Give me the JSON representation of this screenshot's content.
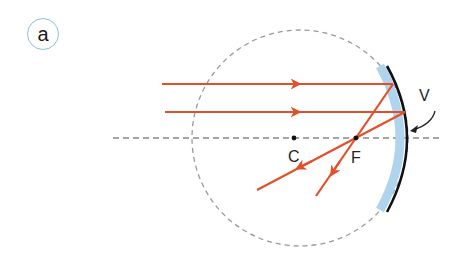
{
  "panel": {
    "label": "a"
  },
  "labels": {
    "center": "C",
    "focus": "F",
    "vertex": "V"
  },
  "colors": {
    "ray": "#e2502a",
    "mirror": "#111111",
    "mirror_surface": "#aed4ee",
    "axis": "#888888",
    "circle": "#999999",
    "badge_border": "#8fbfdc"
  }
}
